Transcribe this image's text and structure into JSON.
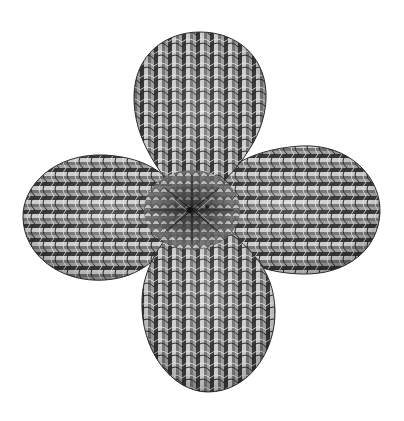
{
  "figure": {
    "kind": "rendered-3d-surface",
    "background": "#ffffff",
    "shading": {
      "light": "#e6e6e6",
      "mid": "#9a9a9a",
      "dark": "#2a2a2a",
      "line": "#555555"
    },
    "center": {
      "x": 192,
      "y": 210
    },
    "lobes": [
      {
        "name": "top",
        "cx": 200,
        "cy": 112,
        "rx": 67,
        "ry": 82,
        "stem_to": [
          192,
          210
        ]
      },
      {
        "name": "right",
        "cx": 318,
        "cy": 210,
        "rx": 62,
        "ry": 64,
        "stem_to": [
          192,
          210
        ]
      },
      {
        "name": "bottom",
        "cx": 207,
        "cy": 330,
        "rx": 67,
        "ry": 63,
        "stem_to": [
          192,
          210
        ]
      },
      {
        "name": "left",
        "cx": 86,
        "cy": 218,
        "rx": 64,
        "ry": 64,
        "stem_to": [
          192,
          210
        ]
      }
    ]
  }
}
